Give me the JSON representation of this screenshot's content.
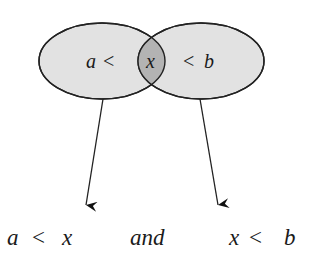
{
  "diagram": {
    "left_set": {
      "label_var": "a",
      "label_op": "<",
      "fill": "#e2e2e2"
    },
    "right_set": {
      "label_op": "<",
      "label_var": "b",
      "fill": "#e2e2e2"
    },
    "intersection": {
      "label": "x",
      "fill": "#b3b3b3"
    },
    "stroke_color": "#222222",
    "bottom": {
      "left_expr": {
        "a": "a",
        "op": "<",
        "x": "x"
      },
      "connector": "and",
      "right_expr": {
        "x": "x",
        "op": "<",
        "b": "b"
      }
    }
  }
}
